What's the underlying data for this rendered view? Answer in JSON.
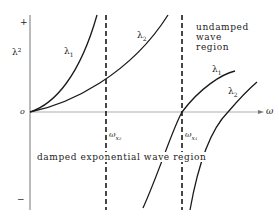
{
  "diagram": {
    "axes": {
      "y_label": "λ²",
      "y_plus": "+",
      "y_minus": "−",
      "origin": "o",
      "x_label": "ω"
    },
    "curves": [
      {
        "id": "lambda1-left",
        "label": "λ",
        "subscript": "1"
      },
      {
        "id": "lambda2-left",
        "label": "λ",
        "subscript": "2"
      },
      {
        "id": "lambda1-right",
        "label": "λ",
        "subscript": "1"
      },
      {
        "id": "lambda2-right",
        "label": "λ",
        "subscript": "2"
      }
    ],
    "cutoffs": [
      {
        "id": "omega-x2",
        "label": "ω",
        "subscript": "x₂"
      },
      {
        "id": "omega-x1",
        "label": "ω",
        "subscript": "x₁"
      }
    ],
    "regions": {
      "undamped": [
        "undamped",
        "wave",
        "region"
      ],
      "damped": "damped exponential wave region"
    },
    "colors": {
      "line": "#1a1a1a",
      "axis": "#555555",
      "background": "#ffffff"
    }
  }
}
